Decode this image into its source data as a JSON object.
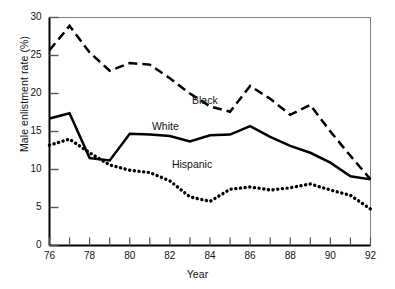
{
  "chart_data": {
    "type": "line",
    "title": "",
    "xlabel": "Year",
    "ylabel": "Male enlistment rate (%)",
    "xlim": [
      76,
      92
    ],
    "ylim": [
      0,
      30
    ],
    "xticks": [
      76,
      77,
      78,
      79,
      80,
      81,
      82,
      83,
      84,
      85,
      86,
      87,
      88,
      89,
      90,
      91,
      92
    ],
    "xtick_labels": [
      "76",
      "",
      "78",
      "",
      "80",
      "",
      "82",
      "",
      "84",
      "",
      "86",
      "",
      "88",
      "",
      "90",
      "",
      "92"
    ],
    "yticks": [
      0,
      5,
      10,
      15,
      20,
      25,
      30
    ],
    "ytick_labels": [
      "0",
      "5",
      "10",
      "15",
      "20",
      "25",
      "30"
    ],
    "grid": false,
    "legend": "inline-annotations",
    "x": [
      76,
      77,
      78,
      79,
      80,
      81,
      82,
      83,
      84,
      85,
      86,
      87,
      88,
      89,
      90,
      91,
      92
    ],
    "series": [
      {
        "name": "Black",
        "style": "dashed",
        "color": "#000000",
        "label_x": 84,
        "label_y": 19.0,
        "values": [
          25.7,
          28.9,
          25.4,
          23.0,
          24.0,
          23.8,
          22.0,
          20.0,
          18.3,
          17.6,
          21.0,
          19.3,
          17.2,
          18.5,
          15.0,
          11.8,
          8.7
        ]
      },
      {
        "name": "White",
        "style": "solid",
        "color": "#000000",
        "label_x": 82,
        "label_y": 15.6,
        "values": [
          16.7,
          17.4,
          11.5,
          11.2,
          14.7,
          14.6,
          14.4,
          13.7,
          14.5,
          14.6,
          15.7,
          14.3,
          13.1,
          12.2,
          10.9,
          9.1,
          8.7
        ]
      },
      {
        "name": "Hispanic",
        "style": "dotted",
        "color": "#000000",
        "label_x": 83,
        "label_y": 10.6,
        "values": [
          13.2,
          14.0,
          12.2,
          10.6,
          9.9,
          9.6,
          8.5,
          6.4,
          5.8,
          7.4,
          7.7,
          7.3,
          7.6,
          8.1,
          7.3,
          6.6,
          4.8
        ]
      }
    ],
    "axis_labels": {
      "x_title": "Year",
      "y_title": "Male enlistment rate (%)"
    }
  }
}
